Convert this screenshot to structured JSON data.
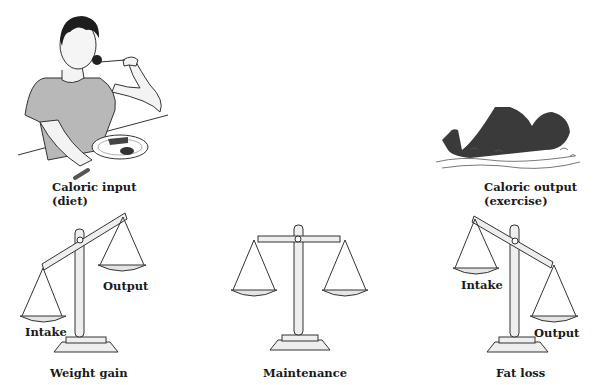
{
  "illustrations": {
    "eater": {
      "caption_line1": "Caloric input",
      "caption_line2": "(diet)"
    },
    "swimmer": {
      "caption_line1": "Caloric output",
      "caption_line2": "(exercise)"
    }
  },
  "scales": [
    {
      "title": "Weight gain",
      "left_pan_label": "Intake",
      "right_pan_label": "Output",
      "tilt": "left-down"
    },
    {
      "title": "Maintenance",
      "tilt": "level"
    },
    {
      "title": "Fat loss",
      "left_pan_label": "Intake",
      "right_pan_label": "Output",
      "tilt": "right-down"
    }
  ],
  "colors": {
    "line": "#333333",
    "fill": "#eeeeee",
    "shirt": "#b5b5b5",
    "swimmer": "#3a3a3a"
  }
}
